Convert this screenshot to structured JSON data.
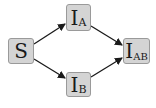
{
  "diagram": {
    "nodes": [
      {
        "id": "S",
        "main": "S",
        "sub": ""
      },
      {
        "id": "IA",
        "main": "I",
        "sub": "A"
      },
      {
        "id": "IB",
        "main": "I",
        "sub": "B"
      },
      {
        "id": "IAB",
        "main": "I",
        "sub": "AB"
      }
    ],
    "edges": [
      {
        "from": "S",
        "to": "IA"
      },
      {
        "from": "S",
        "to": "IB"
      },
      {
        "from": "IA",
        "to": "IAB"
      },
      {
        "from": "IB",
        "to": "IAB"
      }
    ],
    "colors": {
      "node_fill": "#d4d4d4",
      "node_border": "#9a9a9a",
      "arrow": "#1a1a1a"
    }
  }
}
